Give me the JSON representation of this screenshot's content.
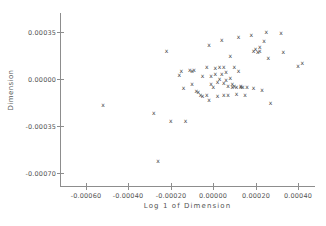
{
  "chart_data": {
    "type": "scatter",
    "title": "",
    "xlabel": "Log 1 of Dimension",
    "ylabel": "Dimension",
    "marker": "x",
    "marker_color": "#3a3a3a",
    "axis_color": "#8d8d8d",
    "grid": false,
    "legend": null,
    "xlim": [
      -0.0007,
      0.0005
    ],
    "ylim": [
      -0.0008,
      0.00045
    ],
    "xticks": [
      -0.0006,
      -0.0004,
      -0.0002,
      0.0,
      0.0002,
      0.0004
    ],
    "xticklabels": [
      "-0.00060",
      "-0.00040",
      "-0.00020",
      "0.00000",
      "0.00020",
      "0.00040"
    ],
    "yticks": [
      0.00035,
      0.0,
      -0.00035,
      -0.0007
    ],
    "yticklabels": [
      "0.00035",
      "0.00000",
      "-0.00035",
      "-0.00070"
    ],
    "points": [
      [
        -0.00052,
        -0.00019
      ],
      [
        -0.00028,
        -0.00025
      ],
      [
        -0.00026,
        -0.00061
      ],
      [
        -0.00022,
        0.00021
      ],
      [
        -0.0002,
        -0.00031
      ],
      [
        -0.00016,
        3e-05
      ],
      [
        -0.00015,
        6e-05
      ],
      [
        -0.00014,
        -7e-05
      ],
      [
        -0.00013,
        -0.00031
      ],
      [
        -0.00011,
        7e-05
      ],
      [
        -0.0001,
        6e-05
      ],
      [
        -0.0001,
        -4e-05
      ],
      [
        -9e-05,
        7e-05
      ],
      [
        -8e-05,
        -9e-05
      ],
      [
        -7e-05,
        -0.0001
      ],
      [
        -6e-05,
        -0.00012
      ],
      [
        -5e-05,
        2e-05
      ],
      [
        -5e-05,
        -0.00013
      ],
      [
        -3e-05,
        9e-05
      ],
      [
        -3e-05,
        -0.00012
      ],
      [
        -2e-05,
        0.00025
      ],
      [
        -2e-05,
        -0.00016
      ],
      [
        -1e-05,
        2e-05
      ],
      [
        -1e-05,
        -4e-05
      ],
      [
        0.0,
        -6e-05
      ],
      [
        1e-05,
        8e-05
      ],
      [
        1e-05,
        4e-05
      ],
      [
        2e-05,
        -2e-05
      ],
      [
        2e-05,
        -0.00013
      ],
      [
        3e-05,
        9e-05
      ],
      [
        3e-05,
        0.0
      ],
      [
        4e-05,
        0.00029
      ],
      [
        4e-05,
        4e-05
      ],
      [
        5e-05,
        9e-05
      ],
      [
        5e-05,
        -3e-05
      ],
      [
        5e-05,
        -0.00012
      ],
      [
        6e-05,
        5e-05
      ],
      [
        6e-05,
        -1e-05
      ],
      [
        7e-05,
        -5e-05
      ],
      [
        7e-05,
        -0.00012
      ],
      [
        8e-05,
        0.00017
      ],
      [
        8e-05,
        1e-05
      ],
      [
        9e-05,
        -4e-05
      ],
      [
        9e-05,
        -6e-05
      ],
      [
        0.0001,
        9e-05
      ],
      [
        0.0001,
        -5e-05
      ],
      [
        0.00011,
        -6e-05
      ],
      [
        0.00011,
        -0.00011
      ],
      [
        0.00012,
        0.00031
      ],
      [
        0.00012,
        6e-05
      ],
      [
        0.00013,
        -5e-05
      ],
      [
        0.00013,
        -6e-05
      ],
      [
        0.00014,
        -6e-05
      ],
      [
        0.00015,
        -0.00012
      ],
      [
        0.00016,
        -6e-05
      ],
      [
        0.00018,
        0.00033
      ],
      [
        0.00019,
        0.00021
      ],
      [
        0.00019,
        -7e-05
      ],
      [
        0.0002,
        0.00022
      ],
      [
        0.00021,
        0.0002
      ],
      [
        0.00022,
        0.00024
      ],
      [
        0.00022,
        0.00021
      ],
      [
        0.00023,
        -8e-05
      ],
      [
        0.00024,
        0.00028
      ],
      [
        0.00025,
        0.00035
      ],
      [
        0.00026,
        0.00016
      ],
      [
        0.00027,
        -0.00018
      ],
      [
        0.00032,
        0.00034
      ],
      [
        0.00033,
        0.0002
      ],
      [
        0.0004,
        0.0001
      ],
      [
        0.00042,
        0.00012
      ]
    ]
  }
}
